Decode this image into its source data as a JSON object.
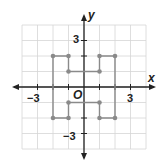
{
  "graph": {
    "x_axis_label": "x",
    "y_axis_label": "y",
    "origin_label": "O",
    "tick_labels": {
      "x_neg": "−3",
      "x_pos": "3",
      "y_pos": "3",
      "y_neg": "−3"
    },
    "range": {
      "xmin": -4,
      "xmax": 4,
      "ymin": -4,
      "ymax": 4
    },
    "colors": {
      "grid": "#d6d6d6",
      "axis": "#222222",
      "figure": "#8a8a8a"
    }
  },
  "figure": {
    "vertices": [
      [
        -2,
        2
      ],
      [
        -1,
        2
      ],
      [
        -1,
        1
      ],
      [
        1,
        1
      ],
      [
        1,
        2
      ],
      [
        2,
        2
      ],
      [
        2,
        -2
      ],
      [
        1,
        -2
      ],
      [
        1,
        -1
      ],
      [
        -1,
        -1
      ],
      [
        -1,
        -2
      ],
      [
        -2,
        -2
      ]
    ]
  }
}
